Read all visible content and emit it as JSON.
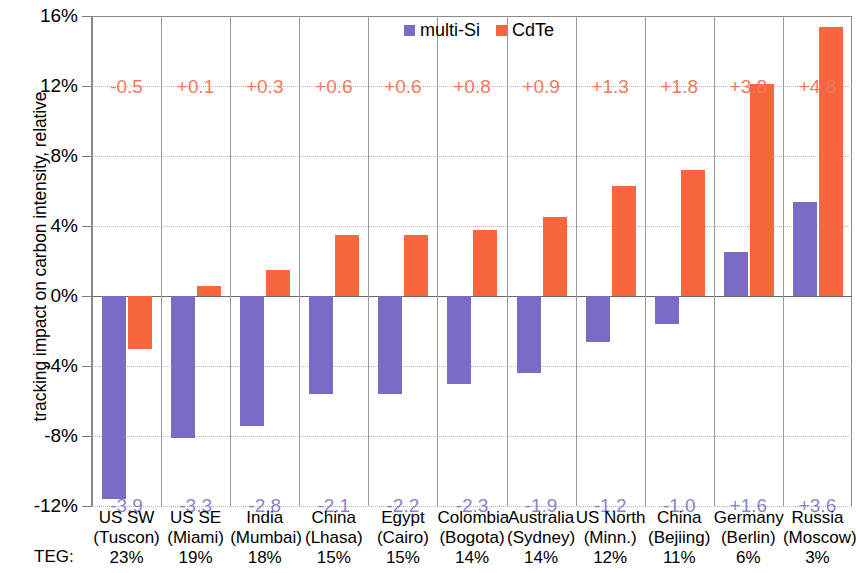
{
  "chart_data": {
    "type": "bar",
    "title": "",
    "xlabel": "",
    "ylabel": "tracking impact on carbon intensity, relative",
    "ylim": [
      -12,
      16
    ],
    "ytick_labels": [
      "16%",
      "12%",
      "8%",
      "4%",
      "0%",
      "-4%",
      "-8%",
      "-12%"
    ],
    "ytick_values": [
      16,
      12,
      8,
      4,
      0,
      -4,
      -8,
      -12
    ],
    "grid": true,
    "legend_position": "top-center",
    "categories": [
      "US SW (Tuscon)",
      "US SE (Miami)",
      "India (Mumbai)",
      "China (Lhasa)",
      "Egypt (Cairo)",
      "Colombia (Bogota)",
      "Australia (Sydney)",
      "US North (Minn.)",
      "China (Bejiing)",
      "Germany (Berlin)",
      "Russia (Moscow)"
    ],
    "series": [
      {
        "name": "multi-Si",
        "color": "#7a6bc4",
        "values": [
          -11.6,
          -8.1,
          -7.4,
          -5.6,
          -5.6,
          -5.0,
          -4.4,
          -2.6,
          -1.6,
          2.5,
          5.4
        ],
        "data_labels": [
          "-3.9",
          "-3.3",
          "-2.8",
          "-2.1",
          "-2.2",
          "-2.3",
          "-1.9",
          "-1.2",
          "-1.0",
          "+1.6",
          "+3.6"
        ]
      },
      {
        "name": "CdTe",
        "color": "#f7663c",
        "values": [
          -3.0,
          0.6,
          1.5,
          3.5,
          3.5,
          3.8,
          4.5,
          6.3,
          7.2,
          12.1,
          15.4
        ],
        "data_labels": [
          "-0.5",
          "+0.1",
          "+0.3",
          "+0.6",
          "+0.6",
          "+0.8",
          "+0.9",
          "+1.3",
          "+1.8",
          "+3.8",
          "+4.8"
        ]
      }
    ]
  },
  "axis": {
    "y_title": "tracking impact on carbon intensity, relative",
    "teg_row_label": "TEG:"
  },
  "legend": {
    "items": [
      {
        "label": "multi-Si",
        "color": "#7a6bc4"
      },
      {
        "label": "CdTe",
        "color": "#f7663c"
      }
    ]
  },
  "xaxis": {
    "categories": [
      {
        "line1": "US SW",
        "line2": "(Tuscon)",
        "teg": "23%"
      },
      {
        "line1": "US SE",
        "line2": "(Miami)",
        "teg": "19%"
      },
      {
        "line1": "India",
        "line2": "(Mumbai)",
        "teg": "18%"
      },
      {
        "line1": "China",
        "line2": "(Lhasa)",
        "teg": "15%"
      },
      {
        "line1": "Egypt",
        "line2": "(Cairo)",
        "teg": "15%"
      },
      {
        "line1": "Colombia",
        "line2": "(Bogota)",
        "teg": "14%"
      },
      {
        "line1": "Australia",
        "line2": "(Sydney)",
        "teg": "14%"
      },
      {
        "line1": "US North",
        "line2": "(Minn.)",
        "teg": "12%"
      },
      {
        "line1": "China",
        "line2": "(Bejiing)",
        "teg": "11%"
      },
      {
        "line1": "Germany",
        "line2": "(Berlin)",
        "teg": "6%"
      },
      {
        "line1": "Russia",
        "line2": "(Moscow)",
        "teg": "3%"
      }
    ]
  }
}
